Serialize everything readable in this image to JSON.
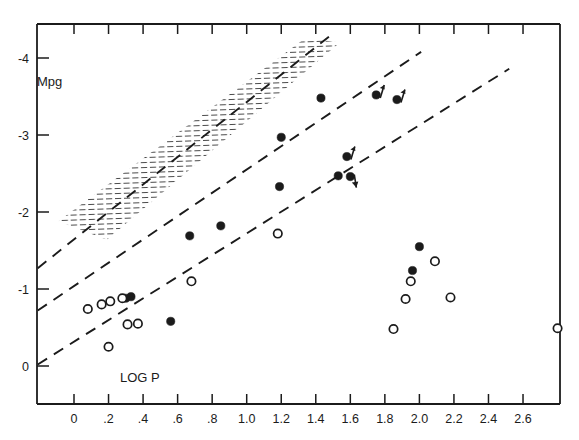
{
  "figure": {
    "background": "#ffffff",
    "ink": "#1b1b1b",
    "frame": {
      "left_px": 37,
      "top_px": 24,
      "right_px": 560,
      "bottom_px": 404
    }
  },
  "chart_data": {
    "type": "scatter",
    "title": "",
    "xlabel": "LOG P",
    "ylabel": "Mpg",
    "xlim": [
      -0.215,
      2.82
    ],
    "ylim": [
      0.49,
      -4.42
    ],
    "grid": false,
    "legend": null,
    "x_ticks": [
      0,
      0.2,
      0.4,
      0.6,
      0.8,
      1.0,
      1.2,
      1.4,
      1.6,
      1.8,
      2.0,
      2.2,
      2.4,
      2.6
    ],
    "x_tick_labels": [
      "0",
      ".2",
      ".4",
      ".6",
      ".8",
      "1.0",
      "1.2",
      "1.4",
      "1.6",
      "1.8",
      "2.0",
      "2.2",
      "2.4",
      "2.6"
    ],
    "y_ticks": [
      -4,
      -3,
      -2,
      -1,
      0
    ],
    "y_tick_labels": [
      "-4",
      "-3",
      "-2",
      "-1",
      "0"
    ],
    "axis_note": "y axis inverted (brighter magnitudes upward)",
    "series": [
      {
        "name": "filled-circles",
        "marker": "filled-circle",
        "points": [
          {
            "x": 0.3,
            "y": -0.88
          },
          {
            "x": 0.33,
            "y": -0.9
          },
          {
            "x": 0.56,
            "y": -0.58
          },
          {
            "x": 0.67,
            "y": -1.69
          },
          {
            "x": 0.85,
            "y": -1.82
          },
          {
            "x": 1.19,
            "y": -2.33
          },
          {
            "x": 1.2,
            "y": -2.97
          },
          {
            "x": 1.43,
            "y": -3.48
          },
          {
            "x": 1.53,
            "y": -2.47
          },
          {
            "x": 1.58,
            "y": -2.72
          },
          {
            "x": 1.6,
            "y": -2.46
          },
          {
            "x": 1.75,
            "y": -3.52
          },
          {
            "x": 1.87,
            "y": -3.46
          },
          {
            "x": 2.0,
            "y": -1.55
          },
          {
            "x": 1.96,
            "y": -1.24
          }
        ]
      },
      {
        "name": "open-circles",
        "marker": "open-circle",
        "points": [
          {
            "x": 0.08,
            "y": -0.74
          },
          {
            "x": 0.16,
            "y": -0.8
          },
          {
            "x": 0.21,
            "y": -0.84
          },
          {
            "x": 0.28,
            "y": -0.88
          },
          {
            "x": 0.31,
            "y": -0.54
          },
          {
            "x": 0.37,
            "y": -0.55
          },
          {
            "x": 0.2,
            "y": -0.25
          },
          {
            "x": 0.68,
            "y": -1.1
          },
          {
            "x": 1.18,
            "y": -1.72
          },
          {
            "x": 1.95,
            "y": -1.1
          },
          {
            "x": 2.09,
            "y": -1.36
          },
          {
            "x": 1.92,
            "y": -0.87
          },
          {
            "x": 2.18,
            "y": -0.89
          },
          {
            "x": 1.85,
            "y": -0.48
          },
          {
            "x": 2.8,
            "y": -0.49
          }
        ]
      }
    ],
    "arrow_markers": [
      {
        "x": 1.75,
        "y": -3.52,
        "direction": "up-right"
      },
      {
        "x": 1.87,
        "y": -3.46,
        "direction": "up-right"
      },
      {
        "x": 1.58,
        "y": -2.72,
        "direction": "up-right"
      },
      {
        "x": 1.6,
        "y": -2.46,
        "direction": "down"
      }
    ],
    "dashed_lines": [
      {
        "name": "upper-ridge-line",
        "x1": -0.21,
        "y1": -1.27,
        "x2": 1.5,
        "y2": -4.32
      },
      {
        "name": "middle-ridge-line",
        "x1": -0.21,
        "y1": -0.72,
        "x2": 2.01,
        "y2": -4.08
      },
      {
        "name": "lower-ridge-line",
        "x1": -0.21,
        "y1": -0.02,
        "x2": 2.52,
        "y2": -3.86
      }
    ],
    "hatched_band": {
      "name": "instability-strip",
      "fill": "hatched-diagonal",
      "polygon": [
        {
          "x": -0.09,
          "y": -1.88
        },
        {
          "x": 1.34,
          "y": -4.26
        },
        {
          "x": 1.54,
          "y": -4.2
        },
        {
          "x": 0.19,
          "y": -1.64
        }
      ]
    }
  },
  "axis_labels": {
    "x_label": "LOG P",
    "y_label": "Mpg"
  }
}
